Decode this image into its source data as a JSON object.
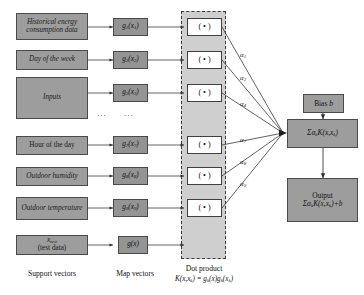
{
  "diagram": {
    "colors": {
      "support_vector_fill": "#9d9d9d",
      "map_vector_fill": "#949494",
      "dot_panel_fill": "#cfcfcf",
      "dot_box_fill": "#ffffff",
      "right_box_fill": "#9d9d9d",
      "line": "#3a3a3a",
      "border": "#4a4a4a",
      "background": "#ffffff"
    }
  },
  "support_vectors": [
    {
      "label": "Historical energy consumption data"
    },
    {
      "label": "Day of the week"
    },
    {
      "label": "Inputs"
    },
    {
      "label": "Hour of the day"
    },
    {
      "label": "Outdoor humidity"
    },
    {
      "label": "Outdoor temperature"
    },
    {
      "label": "x_test (test data)"
    }
  ],
  "map_vectors": [
    {
      "label": "g1(x1)"
    },
    {
      "label": "g2(x2)"
    },
    {
      "label": "g3(x3)"
    },
    {
      "label": "g7(x7)"
    },
    {
      "label": "g8(x8)"
    },
    {
      "label": "g9(x9)"
    },
    {
      "label": "g(x)"
    }
  ],
  "dot_products": [
    {
      "label": "( • )"
    },
    {
      "label": "( • )"
    },
    {
      "label": "( • )"
    },
    {
      "label": "( • )"
    },
    {
      "label": "( • )"
    },
    {
      "label": "( • )"
    }
  ],
  "alphas": [
    {
      "label": "α1"
    },
    {
      "label": "α2"
    },
    {
      "label": "α4"
    },
    {
      "label": "α7"
    },
    {
      "label": "α8"
    },
    {
      "label": "α9"
    }
  ],
  "right_chain": {
    "bias_label": "Bias b",
    "sum_label": "ΣαkK(x,xk)",
    "output_title": "Output",
    "output_formula": "ΣαkK(x,xk)+b"
  },
  "captions": {
    "support_vectors": "Support vectors",
    "map_vectors": "Map vectors",
    "dot_product": "Dot product",
    "dot_product_formula": "K(x,xk) = gk(x)gk(xk)"
  },
  "ellipsis": {
    "support_column": "...",
    "map_column": "..."
  }
}
